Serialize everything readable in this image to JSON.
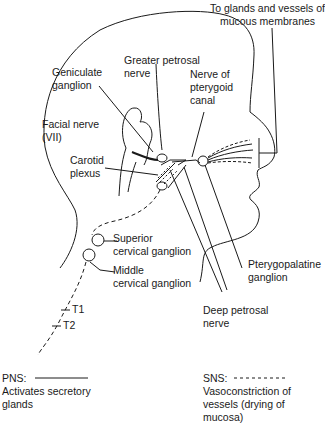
{
  "diagram": {
    "labels": {
      "top_right": "To glands and vessels of\nmucous membranes",
      "greater_petrosal": "Greater petrosal\nnerve",
      "geniculate": "Geniculate\nganglion",
      "pterygoid_canal": "Nerve of\npterygoid\ncanal",
      "facial_nerve": "Facial nerve\n(VII)",
      "carotid_plexus": "Carotid\nplexus",
      "superior_cervical": "Superior\ncervical ganglion",
      "middle_cervical": "Middle\ncervical ganglion",
      "pterygopalatine": "Pterygopalatine\nganglion",
      "deep_petrosal": "Deep petrosal\nnerve",
      "t1": "T1",
      "t2": "T2"
    },
    "legend": {
      "pns_label": "PNS:",
      "pns_desc": "Activates secretory\nglands",
      "pns_line_style": "solid",
      "sns_label": "SNS:",
      "sns_desc": "Vasoconstriction of\nvessels (drying of\nmucosa)",
      "sns_line_style": "dashed"
    },
    "colors": {
      "line": "#1a1a1a",
      "background": "#ffffff"
    }
  }
}
